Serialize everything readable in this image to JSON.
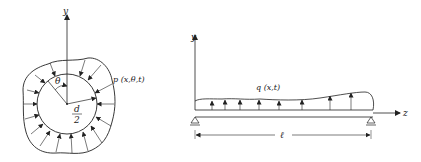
{
  "left_figure": {
    "axis_label": "y",
    "angle_label": "θ",
    "pressure_label": "p (x,θ,t)",
    "radius_numerator": "d",
    "radius_denominator": "2"
  },
  "right_figure": {
    "y_axis_label": "y",
    "z_axis_label": "z",
    "load_label": "q (x,t)",
    "length_label": "ℓ"
  },
  "colors": {
    "stroke": "#222222",
    "background": "#ffffff"
  }
}
